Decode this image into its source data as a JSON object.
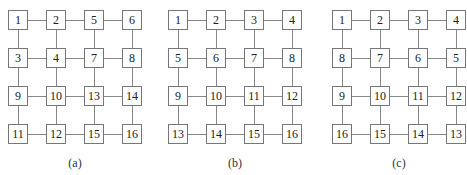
{
  "figure": {
    "panels": [
      {
        "caption": "(a)",
        "grid": [
          [
            "1",
            "2",
            "5",
            "6"
          ],
          [
            "3",
            "4",
            "7",
            "8"
          ],
          [
            "9",
            "10",
            "13",
            "14"
          ],
          [
            "11",
            "12",
            "15",
            "16"
          ]
        ]
      },
      {
        "caption": "(b)",
        "grid": [
          [
            "1",
            "2",
            "3",
            "4"
          ],
          [
            "5",
            "6",
            "7",
            "8"
          ],
          [
            "9",
            "10",
            "11",
            "12"
          ],
          [
            "13",
            "14",
            "15",
            "16"
          ]
        ]
      },
      {
        "caption": "(c)",
        "grid": [
          [
            "1",
            "2",
            "3",
            "4"
          ],
          [
            "8",
            "7",
            "6",
            "5"
          ],
          [
            "9",
            "10",
            "11",
            "12"
          ],
          [
            "16",
            "15",
            "14",
            "13"
          ]
        ]
      }
    ]
  }
}
